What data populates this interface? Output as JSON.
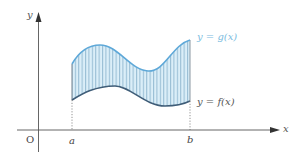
{
  "diagram": {
    "type": "area-between-curves",
    "axes": {
      "x_label": "x",
      "y_label": "y",
      "origin_label": "O"
    },
    "bounds": {
      "a_label": "a",
      "b_label": "b"
    },
    "curves": {
      "upper": {
        "label": "y = g(x)",
        "color": "#5ea8d8"
      },
      "lower": {
        "label": "y = f(x)",
        "color": "#3f5d78"
      }
    },
    "region": {
      "fill_color": "#dbeef8",
      "hatch_color": "#6a9cbc",
      "hatch": "vertical lines"
    },
    "colors": {
      "axis": "#555555",
      "text": "#444444",
      "guide": "#777777"
    }
  }
}
